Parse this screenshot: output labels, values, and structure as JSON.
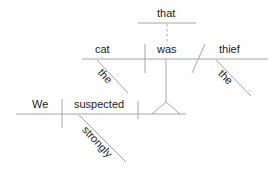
{
  "diagram": {
    "type": "reed-kellogg-sentence-diagram",
    "sentence": "We strongly suspected that the cat was the thief.",
    "stroke_color": "#a6a6a6",
    "text_color": "#1a1a1a",
    "words": {
      "subject_main": "We",
      "verb_main": "suspected",
      "adverb_main": "strongly",
      "subordinator": "that",
      "subject_sub": "cat",
      "article_sub_subject": "the",
      "verb_sub": "was",
      "predicate_nominative": "thief",
      "article_predicate": "the"
    },
    "labels": [
      {
        "id": "that",
        "text": "that",
        "x": 157,
        "y": 8,
        "rotate": 0
      },
      {
        "id": "cat",
        "text": "cat",
        "x": 95,
        "y": 44,
        "rotate": 0
      },
      {
        "id": "was",
        "text": "was",
        "x": 157,
        "y": 44,
        "rotate": 0
      },
      {
        "id": "thief",
        "text": "thief",
        "x": 219,
        "y": 44,
        "rotate": 0
      },
      {
        "id": "the-left",
        "text": "the",
        "x": 104,
        "y": 67,
        "rotate": 48
      },
      {
        "id": "the-right",
        "text": "the",
        "x": 224,
        "y": 68,
        "rotate": 46
      },
      {
        "id": "We",
        "text": "We",
        "x": 32,
        "y": 99,
        "rotate": 0
      },
      {
        "id": "suspected",
        "text": "suspected",
        "x": 74,
        "y": 99,
        "rotate": 0
      },
      {
        "id": "strongly",
        "text": "strongly",
        "x": 88,
        "y": 124,
        "rotate": 47
      }
    ],
    "lines": [
      {
        "id": "that-baseline",
        "x1": 138,
        "y1": 23,
        "x2": 196,
        "y2": 23,
        "style": "solid"
      },
      {
        "id": "that-to-was-connector",
        "x1": 167,
        "y1": 24,
        "x2": 167,
        "y2": 45,
        "style": "dashed"
      },
      {
        "id": "subclause-baseline",
        "x1": 82,
        "y1": 59,
        "x2": 268,
        "y2": 59,
        "style": "solid"
      },
      {
        "id": "subject-verb-divider",
        "x1": 145,
        "y1": 44,
        "x2": 145,
        "y2": 73,
        "style": "solid"
      },
      {
        "id": "predicate-slant",
        "x1": 192,
        "y1": 73,
        "x2": 205,
        "y2": 44,
        "style": "solid"
      },
      {
        "id": "article-cat-slant",
        "x1": 97,
        "y1": 60,
        "x2": 128,
        "y2": 93,
        "style": "solid"
      },
      {
        "id": "article-thief-slant",
        "x1": 216,
        "y1": 60,
        "x2": 251,
        "y2": 96,
        "style": "solid"
      },
      {
        "id": "clause-stem",
        "x1": 166,
        "y1": 59,
        "x2": 166,
        "y2": 102,
        "style": "solid"
      },
      {
        "id": "tripod-left-leg",
        "x1": 166,
        "y1": 102,
        "x2": 152,
        "y2": 114,
        "style": "solid"
      },
      {
        "id": "tripod-right-leg",
        "x1": 166,
        "y1": 102,
        "x2": 180,
        "y2": 114,
        "style": "solid"
      },
      {
        "id": "main-baseline",
        "x1": 16,
        "y1": 114,
        "x2": 186,
        "y2": 114,
        "style": "solid"
      },
      {
        "id": "main-subject-divider",
        "x1": 62,
        "y1": 99,
        "x2": 62,
        "y2": 128,
        "style": "solid"
      },
      {
        "id": "verb-object-divider",
        "x1": 138,
        "y1": 101,
        "x2": 138,
        "y2": 119,
        "style": "solid"
      },
      {
        "id": "adverb-slant",
        "x1": 79,
        "y1": 115,
        "x2": 126,
        "y2": 162,
        "style": "solid"
      }
    ]
  }
}
